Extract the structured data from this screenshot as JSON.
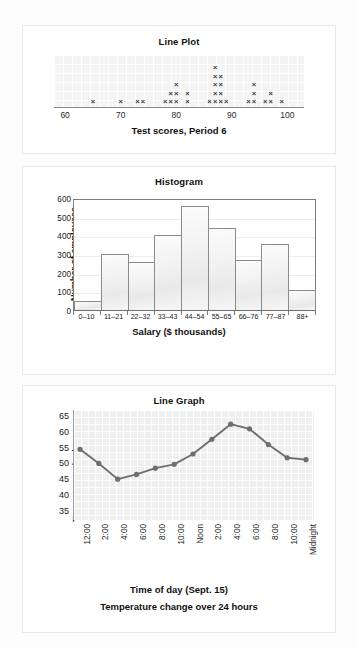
{
  "page": {
    "background_color": "#fdfdfd",
    "card_color": "#ffffff",
    "card_border_color": "#e8e8e8"
  },
  "chart_data": [
    {
      "type": "dot",
      "title": "Line Plot",
      "xlabel": "Test scores, Period 6",
      "ylabel": "",
      "mark_glyph": "×",
      "xlim": [
        58,
        103
      ],
      "ticks": [
        60,
        70,
        80,
        90,
        100
      ],
      "grid": true,
      "columns": [
        {
          "x": 65,
          "count": 1
        },
        {
          "x": 70,
          "count": 1
        },
        {
          "x": 73,
          "count": 1
        },
        {
          "x": 74,
          "count": 1
        },
        {
          "x": 78,
          "count": 1
        },
        {
          "x": 79,
          "count": 2
        },
        {
          "x": 80,
          "count": 3
        },
        {
          "x": 82,
          "count": 2
        },
        {
          "x": 86,
          "count": 1
        },
        {
          "x": 87,
          "count": 5
        },
        {
          "x": 88,
          "count": 4
        },
        {
          "x": 89,
          "count": 1
        },
        {
          "x": 93,
          "count": 1
        },
        {
          "x": 94,
          "count": 3
        },
        {
          "x": 96,
          "count": 1
        },
        {
          "x": 97,
          "count": 2
        },
        {
          "x": 99,
          "count": 1
        }
      ]
    },
    {
      "type": "bar",
      "title": "Histogram",
      "xlabel": "Salary ($ thousands)",
      "ylabel": "Number of employees",
      "categories": [
        "0–10",
        "11–21",
        "22–32",
        "33–43",
        "44–54",
        "55–65",
        "66–76",
        "77–87",
        "88+"
      ],
      "values": [
        50,
        300,
        255,
        400,
        555,
        440,
        268,
        352,
        108
      ],
      "ylim": [
        0,
        600
      ],
      "yticks": [
        0,
        100,
        200,
        300,
        400,
        500,
        600
      ],
      "grid": true,
      "bar_fill": "#f2f2f2",
      "bar_stroke": "#8b8b8b"
    },
    {
      "type": "line",
      "title": "Line Graph",
      "xlabel": "Time of day (Sept. 15)",
      "ylabel": "Temperature in degrees",
      "caption": "Temperature change over 24 hours",
      "x": [
        "12:00",
        "2:00",
        "4:00",
        "6:00",
        "8:00",
        "10:00",
        "Noon",
        "2:00",
        "4:00",
        "6:00",
        "8:00",
        "10:00",
        "Midnight"
      ],
      "values": [
        54.5,
        50.0,
        45.0,
        46.5,
        48.5,
        49.7,
        53.0,
        57.7,
        62.5,
        61.0,
        56.0,
        51.8,
        51.2
      ],
      "ylim": [
        32,
        67
      ],
      "yticks": [
        35,
        40,
        45,
        50,
        55,
        60,
        65
      ],
      "grid": true,
      "line_color": "#6e6e6e",
      "marker_color": "#6e6e6e"
    }
  ]
}
